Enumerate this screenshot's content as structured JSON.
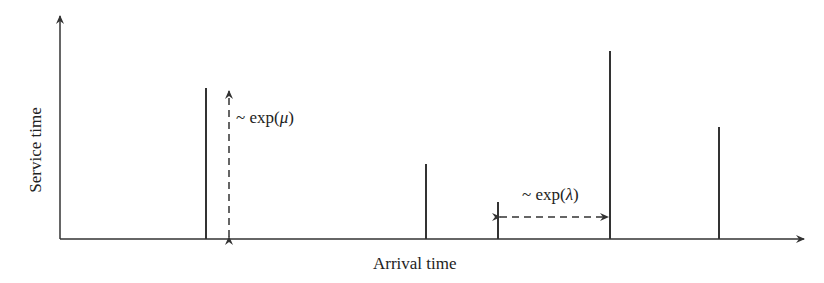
{
  "diagram": {
    "x_axis_label": "Arrival time",
    "y_axis_label": "Service time",
    "service_annotation": {
      "prefix": "~ exp(",
      "param": "μ",
      "suffix": ")"
    },
    "interarrival_annotation": {
      "prefix": "~ exp(",
      "param": "λ",
      "suffix": ")"
    },
    "line_color": "#333333",
    "spikes": [
      {
        "x": 206,
        "top": 88
      },
      {
        "x": 426,
        "top": 164
      },
      {
        "x": 498,
        "top": 202
      },
      {
        "x": 610,
        "top": 51
      },
      {
        "x": 719,
        "top": 127
      }
    ]
  }
}
